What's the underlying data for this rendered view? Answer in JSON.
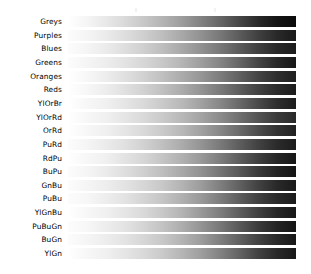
{
  "figure": {
    "title": "",
    "background_color": "#ffffff",
    "width": 311,
    "height": 274,
    "rendering": "grayscale",
    "colormap_category": "Sequential"
  },
  "layout": {
    "bar_left": 68,
    "bar_right": 296,
    "bar_width": 228,
    "bar_height": 11,
    "row_pitch": 13.65,
    "first_row_top": 16,
    "label_right_edge": 62,
    "label_font_size": 7.4
  },
  "chart_data": {
    "type": "heatmap",
    "title": "",
    "subtitle": "",
    "xlabel": "",
    "ylabel": "",
    "legend_position": "none",
    "grid": false,
    "x": [
      0,
      1
    ],
    "xlim": [
      0,
      1
    ],
    "note": "Each row is a horizontal colormap gradient strip sampled from 0 to 1, rendered in grayscale (luminance only).",
    "categories": [
      "Greys",
      "Purples",
      "Blues",
      "Greens",
      "Oranges",
      "Reds",
      "YlOrBr",
      "YlOrRd",
      "OrRd",
      "PuRd",
      "RdPu",
      "BuPu",
      "GnBu",
      "PuBu",
      "YlGnBu",
      "PuBuGn",
      "BuGn",
      "YlGn"
    ],
    "series": [
      {
        "name": "Greys",
        "stops": [
          100,
          96,
          91,
          85,
          78,
          70,
          61,
          51,
          40,
          28,
          16,
          8,
          4
        ]
      },
      {
        "name": "Purples",
        "stops": [
          99,
          96,
          92,
          87,
          81,
          74,
          66,
          57,
          47,
          36,
          25,
          16,
          10
        ]
      },
      {
        "name": "Blues",
        "stops": [
          99,
          96,
          92,
          87,
          81,
          74,
          66,
          57,
          47,
          36,
          25,
          16,
          11
        ]
      },
      {
        "name": "Greens",
        "stops": [
          99,
          96,
          93,
          89,
          84,
          78,
          71,
          62,
          52,
          40,
          27,
          16,
          9
        ]
      },
      {
        "name": "Oranges",
        "stops": [
          100,
          97,
          93,
          88,
          82,
          75,
          67,
          59,
          49,
          38,
          27,
          18,
          12
        ]
      },
      {
        "name": "Reds",
        "stops": [
          100,
          97,
          93,
          88,
          82,
          75,
          67,
          58,
          48,
          37,
          26,
          17,
          11
        ]
      },
      {
        "name": "YlOrBr",
        "stops": [
          100,
          97,
          94,
          90,
          85,
          79,
          72,
          63,
          53,
          41,
          29,
          18,
          11
        ]
      },
      {
        "name": "YlOrRd",
        "stops": [
          100,
          97,
          94,
          90,
          85,
          79,
          72,
          64,
          55,
          44,
          33,
          23,
          16
        ]
      },
      {
        "name": "OrRd",
        "stops": [
          100,
          97,
          94,
          90,
          85,
          79,
          72,
          63,
          53,
          42,
          30,
          20,
          13
        ]
      },
      {
        "name": "PuRd",
        "stops": [
          99,
          96,
          92,
          88,
          82,
          75,
          67,
          58,
          48,
          37,
          26,
          17,
          11
        ]
      },
      {
        "name": "RdPu",
        "stops": [
          100,
          97,
          94,
          89,
          84,
          77,
          69,
          60,
          49,
          37,
          25,
          15,
          9
        ]
      },
      {
        "name": "BuPu",
        "stops": [
          99,
          96,
          92,
          87,
          81,
          74,
          66,
          57,
          46,
          35,
          23,
          14,
          8
        ]
      },
      {
        "name": "GnBu",
        "stops": [
          99,
          96,
          93,
          89,
          84,
          78,
          70,
          61,
          50,
          38,
          26,
          16,
          10
        ]
      },
      {
        "name": "PuBu",
        "stops": [
          99,
          97,
          93,
          89,
          83,
          77,
          69,
          60,
          49,
          37,
          25,
          16,
          10
        ]
      },
      {
        "name": "YlGnBu",
        "stops": [
          100,
          97,
          94,
          90,
          85,
          78,
          70,
          60,
          49,
          37,
          25,
          15,
          9
        ]
      },
      {
        "name": "PuBuGn",
        "stops": [
          99,
          97,
          93,
          89,
          83,
          76,
          68,
          58,
          47,
          35,
          23,
          14,
          8
        ]
      },
      {
        "name": "BuGn",
        "stops": [
          99,
          96,
          93,
          89,
          84,
          78,
          70,
          61,
          50,
          38,
          26,
          16,
          9
        ]
      },
      {
        "name": "YlGn",
        "stops": [
          100,
          97,
          94,
          90,
          85,
          79,
          71,
          62,
          51,
          39,
          26,
          16,
          9
        ]
      }
    ]
  }
}
